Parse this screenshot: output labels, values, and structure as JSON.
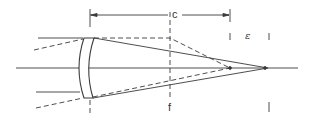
{
  "diagram": {
    "type": "optical-ray-diagram",
    "labels": {
      "c": "c",
      "f": "f",
      "epsilon": "ε"
    },
    "colors": {
      "line": "#3a3a3a",
      "background": "#ffffff"
    }
  }
}
